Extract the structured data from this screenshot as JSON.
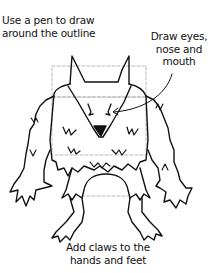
{
  "illustration": {
    "subject": "monster-outline",
    "stroke_color": "#111111",
    "guide_color": "#b0b0b0",
    "background": "#ffffff"
  },
  "callouts": {
    "outline": {
      "lines": [
        "Use a pen to draw",
        "around the outline"
      ]
    },
    "face": {
      "lines": [
        "Draw eyes,",
        "nose and",
        "mouth"
      ]
    },
    "claws": {
      "lines": [
        "Add claws to the",
        "hands and feet"
      ]
    }
  }
}
